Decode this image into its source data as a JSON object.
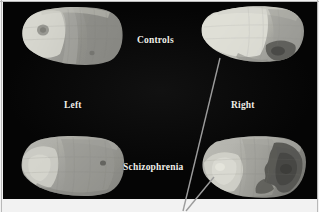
{
  "figure": {
    "kind": "brain-surface-map-figure",
    "panel_background": "#050505",
    "page_background": "#ffffff",
    "border_color": "#b9b9b9"
  },
  "labels": {
    "controls": "Controls",
    "left": "Left",
    "right": "Right",
    "schizophrenia": "Schizophrenia",
    "color": "#f0efe9"
  },
  "panels": [
    {
      "id": "controls-left",
      "group": "Controls",
      "hemisphere": "Left",
      "position": "top-left",
      "description": "Lateral surface map, bright anterior region, mid-gray posterior, small dark focal spot in frontal area"
    },
    {
      "id": "controls-right",
      "group": "Controls",
      "hemisphere": "Right",
      "position": "top-right",
      "description": "Lateral surface map, predominantly bright, dark patch in inferior posterior region"
    },
    {
      "id": "schizophrenia-left",
      "group": "Schizophrenia",
      "hemisphere": "Left",
      "position": "bottom-left",
      "description": "Lateral surface map, overall mid-gray with bright anterior patch, small dark spot posteriorly"
    },
    {
      "id": "schizophrenia-right",
      "group": "Schizophrenia",
      "hemisphere": "Right",
      "position": "bottom-right",
      "description": "Lateral surface map, bright anterior region with large dark posterior region"
    }
  ],
  "leader_lines": [
    {
      "id": "leader-long",
      "from": "controls-right-inferior-edge",
      "to": "figure-bottom-callout",
      "color": "#9c9c9c"
    },
    {
      "id": "leader-short",
      "from": "schizophrenia-right-anterior-edge",
      "to": "figure-bottom-callout",
      "color": "#9c9c9c"
    }
  ],
  "grayscale_map": {
    "type": "heatmap",
    "scale": "grayscale",
    "dark_value_meaning": "low",
    "bright_value_meaning": "high"
  }
}
